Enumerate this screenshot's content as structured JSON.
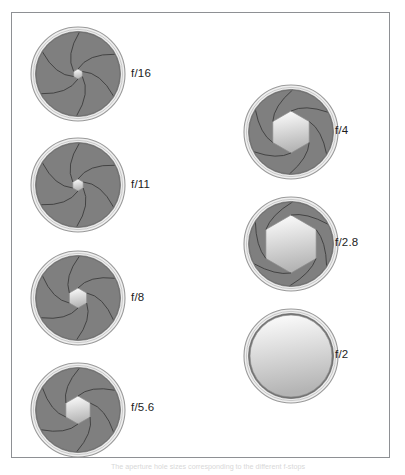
{
  "figure": {
    "caption": "The aperture hole sizes corresponding to the different f-stops",
    "frame_color": "#8e9094",
    "background_color": "#ffffff"
  },
  "colors": {
    "blade_fill": "#7f7f7f",
    "blade_line": "#3c3c3c",
    "ring_outer": "#9a9a9a",
    "ring_inner": "#c9c9c9",
    "opening_light": "#ffffff",
    "opening_shade": "#b4b4b4",
    "label_text": "#1d1d1d"
  },
  "apertures": [
    {
      "id": "f16",
      "label": "f/16",
      "column": "left",
      "fstop_value": 16,
      "opening_radius_px": 5,
      "opening_shape": "hexagon",
      "blade_count": 6,
      "disc_diameter_px": 94,
      "disc_x": 30,
      "disc_y": 26,
      "label_x": 130,
      "label_y": 67
    },
    {
      "id": "f11",
      "label": "f/11",
      "column": "left",
      "fstop_value": 11,
      "opening_radius_px": 6,
      "opening_shape": "hexagon",
      "blade_count": 6,
      "disc_diameter_px": 94,
      "disc_x": 30,
      "disc_y": 137,
      "label_x": 130,
      "label_y": 178
    },
    {
      "id": "f8",
      "label": "f/8",
      "column": "left",
      "fstop_value": 8,
      "opening_radius_px": 10,
      "opening_shape": "hexagon",
      "blade_count": 6,
      "disc_diameter_px": 94,
      "disc_x": 30,
      "disc_y": 250,
      "label_x": 130,
      "label_y": 291
    },
    {
      "id": "f56",
      "label": "f/5.6",
      "column": "left",
      "fstop_value": 5.6,
      "opening_radius_px": 14,
      "opening_shape": "hexagon",
      "blade_count": 6,
      "disc_diameter_px": 94,
      "disc_x": 30,
      "disc_y": 362,
      "label_x": 130,
      "label_y": 401
    },
    {
      "id": "f4",
      "label": "f/4",
      "column": "right",
      "fstop_value": 4,
      "opening_radius_px": 21,
      "opening_shape": "hexagon",
      "blade_count": 6,
      "disc_diameter_px": 94,
      "disc_x": 243,
      "disc_y": 84,
      "label_x": 334,
      "label_y": 124
    },
    {
      "id": "f28",
      "label": "f/2.8",
      "column": "right",
      "fstop_value": 2.8,
      "opening_radius_px": 29,
      "opening_shape": "hexagon",
      "blade_count": 6,
      "disc_diameter_px": 94,
      "disc_x": 243,
      "disc_y": 196,
      "label_x": 334,
      "label_y": 236
    },
    {
      "id": "f2",
      "label": "f/2",
      "column": "right",
      "fstop_value": 2,
      "opening_radius_px": 41,
      "opening_shape": "circle",
      "blade_count": 0,
      "disc_diameter_px": 94,
      "disc_x": 243,
      "disc_y": 308,
      "label_x": 334,
      "label_y": 348
    }
  ]
}
